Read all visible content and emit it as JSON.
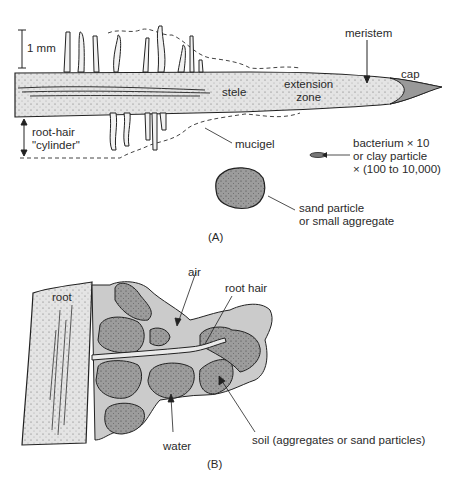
{
  "panel_a": {
    "label": "(A)",
    "scale_bar": "1 mm",
    "labels": {
      "meristem": "meristem",
      "cap": "cap",
      "stele": "stele",
      "extension_zone_1": "extension",
      "extension_zone_2": "zone",
      "root_hair_cylinder_1": "root-hair",
      "root_hair_cylinder_2": "\"cylinder\"",
      "mucigel": "mucigel",
      "bacterium_1": "bacterium × 10",
      "bacterium_2": "or clay particle",
      "bacterium_3": "× (100 to 10,000)",
      "sand_1": "sand particle",
      "sand_2": "or small aggregate"
    }
  },
  "panel_b": {
    "label": "(B)",
    "labels": {
      "root": "root",
      "air": "air",
      "root_hair": "root hair",
      "water": "water",
      "soil": "soil (aggregates or sand particles)"
    }
  },
  "colors": {
    "root_fill": "#e6e6e6",
    "particle_fill": "#9a9a9a",
    "water_fill": "#c8c8c8",
    "outline": "#222222"
  }
}
